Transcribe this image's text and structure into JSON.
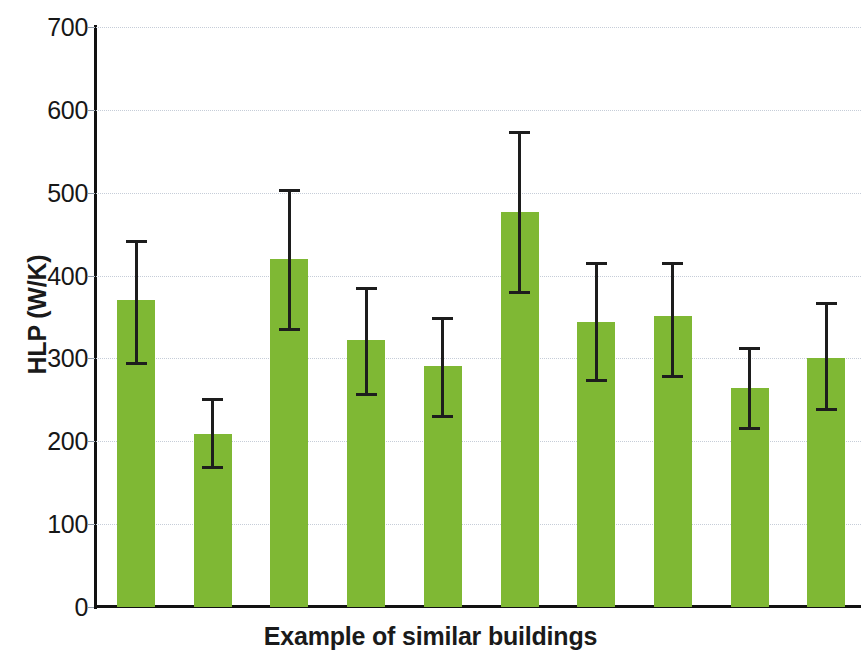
{
  "chart_data": {
    "type": "bar",
    "title": "",
    "xlabel": "Example of similar buildings",
    "ylabel": "HLP (W/K)",
    "ylim": [
      0,
      700
    ],
    "ytick_step": 100,
    "yticks": [
      0,
      100,
      200,
      300,
      400,
      500,
      600,
      700
    ],
    "ytick_labels": [
      "0",
      "100",
      "200",
      "300",
      "400",
      "500",
      "600",
      "700"
    ],
    "grid": true,
    "grid_axis": "y",
    "legend": null,
    "xtick_labels": [
      "",
      "",
      "",
      "",
      "",
      "",
      "",
      "",
      "",
      ""
    ],
    "categories": [
      "1",
      "2",
      "3",
      "4",
      "5",
      "6",
      "7",
      "8",
      "9",
      "10"
    ],
    "values": [
      370,
      209,
      420,
      322,
      291,
      477,
      344,
      351,
      264,
      301
    ],
    "error_upper": [
      443,
      252,
      505,
      386,
      350,
      574,
      416,
      416,
      314,
      368
    ],
    "error_lower": [
      292,
      166,
      333,
      255,
      228,
      378,
      272,
      276,
      214,
      237
    ],
    "series": [
      {
        "name": "HLP",
        "values": [
          370,
          209,
          420,
          322,
          291,
          477,
          344,
          351,
          264,
          301
        ],
        "error_upper": [
          443,
          252,
          505,
          386,
          350,
          574,
          416,
          416,
          314,
          368
        ],
        "error_lower": [
          292,
          166,
          333,
          255,
          228,
          378,
          272,
          276,
          214,
          237
        ],
        "color": "#7fb834"
      }
    ],
    "bar_color": "#7fb834",
    "error_color": "#1d1d1d",
    "grid_color": "#c3cbd6",
    "axis_color": "#111111",
    "text_color": "#1a1a1a",
    "background": "#ffffff"
  }
}
